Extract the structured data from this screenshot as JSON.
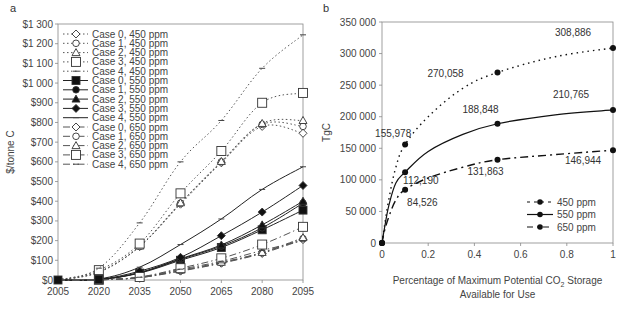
{
  "chart_data": [
    {
      "panel": "a",
      "type": "line",
      "title": "",
      "xlabel": "",
      "ylabel": "$/tonne C",
      "ylim": [
        0,
        1300
      ],
      "y_ticks": [
        "$0",
        "$100",
        "$200",
        "$300",
        "$400",
        "$500",
        "$600",
        "$700",
        "$800",
        "$900",
        "$1 000",
        "$1 100",
        "$1 200",
        "$1 300"
      ],
      "x": [
        "2005",
        "2020",
        "2035",
        "2050",
        "2065",
        "2080",
        "2095"
      ],
      "grid": false,
      "legend_position": "upper-left inside",
      "series": [
        {
          "name": "Case 0, 450 ppm",
          "marker": "diamond-open",
          "style": "dotted",
          "values": [
            0,
            40,
            170,
            385,
            595,
            780,
            745
          ]
        },
        {
          "name": "Case 1, 450 ppm",
          "marker": "circle-open",
          "style": "dotted",
          "values": [
            0,
            40,
            170,
            390,
            600,
            790,
            780
          ]
        },
        {
          "name": "Case 2, 450 ppm",
          "marker": "triangle-open",
          "style": "dotted",
          "values": [
            0,
            42,
            172,
            392,
            602,
            795,
            810
          ]
        },
        {
          "name": "Case 3, 450 ppm",
          "marker": "square-open",
          "style": "dotted",
          "values": [
            0,
            50,
            185,
            440,
            655,
            900,
            950
          ]
        },
        {
          "name": "Case 4, 450 ppm",
          "marker": "dash",
          "style": "dotted",
          "values": [
            0,
            60,
            290,
            600,
            810,
            1075,
            1245
          ]
        },
        {
          "name": "Case 0, 550 ppm",
          "marker": "square-filled",
          "style": "solid",
          "values": [
            0,
            2,
            35,
            100,
            165,
            255,
            355
          ]
        },
        {
          "name": "Case 1, 550 ppm",
          "marker": "circle-filled",
          "style": "solid",
          "values": [
            0,
            2,
            37,
            105,
            172,
            265,
            390
          ]
        },
        {
          "name": "Case 2, 550 ppm",
          "marker": "triangle-filled",
          "style": "solid",
          "values": [
            0,
            2,
            38,
            108,
            178,
            280,
            400
          ]
        },
        {
          "name": "Case 3, 550 ppm",
          "marker": "diamond-filled",
          "style": "solid",
          "values": [
            0,
            3,
            45,
            115,
            225,
            345,
            480
          ]
        },
        {
          "name": "Case 4, 550 ppm",
          "marker": "dash",
          "style": "solid",
          "values": [
            0,
            5,
            65,
            180,
            310,
            460,
            575
          ]
        },
        {
          "name": "Case 0, 650 ppm",
          "marker": "diamond-open",
          "style": "dash-dot",
          "values": [
            0,
            1,
            12,
            45,
            85,
            135,
            205
          ]
        },
        {
          "name": "Case 1, 650 ppm",
          "marker": "circle-open",
          "style": "dash-dot",
          "values": [
            0,
            1,
            12,
            47,
            87,
            138,
            210
          ]
        },
        {
          "name": "Case 2, 650 ppm",
          "marker": "triangle-open",
          "style": "dash-dot",
          "values": [
            0,
            1,
            13,
            50,
            90,
            140,
            215
          ]
        },
        {
          "name": "Case 3, 650 ppm",
          "marker": "square-open",
          "style": "dash-dot",
          "values": [
            0,
            1,
            15,
            60,
            110,
            180,
            270
          ]
        },
        {
          "name": "Case 4, 650 ppm",
          "marker": "dash",
          "style": "dash-dot",
          "values": [
            0,
            1,
            14,
            55,
            95,
            150,
            200
          ]
        }
      ]
    },
    {
      "panel": "b",
      "type": "line",
      "title": "",
      "xlabel": "Percentage of Maximum Potential CO2 Storage Available for Use",
      "xlabel_line1": "Percentage of Maximum Potential CO",
      "xlabel_sub": "2",
      "xlabel_line1_end": " Storage",
      "xlabel_line2": "Available for Use",
      "ylabel": "TgC",
      "ylim": [
        0,
        350000
      ],
      "xlim": [
        0,
        1
      ],
      "y_ticks": [
        "0",
        "50 000",
        "100 000",
        "150 000",
        "200 000",
        "250 000",
        "300 000",
        "350 000"
      ],
      "x_ticks": [
        "0",
        "0.2",
        "0.4",
        "0.6",
        "0.8",
        "1"
      ],
      "grid": false,
      "legend_position": "lower-right inside",
      "series": [
        {
          "name": "450 ppm",
          "style": "dotted",
          "x": [
            0,
            0.1,
            0.5,
            1
          ],
          "values": [
            0,
            155978,
            270058,
            308886
          ],
          "labels": [
            "",
            "155,978",
            "270,058",
            "308,886"
          ]
        },
        {
          "name": "550 ppm",
          "style": "solid",
          "x": [
            0,
            0.1,
            0.5,
            1
          ],
          "values": [
            0,
            112190,
            188848,
            210765
          ],
          "labels": [
            "",
            "112,190",
            "188,848",
            "210,765"
          ]
        },
        {
          "name": "650 ppm",
          "style": "dash-dot",
          "x": [
            0,
            0.1,
            0.5,
            1
          ],
          "values": [
            0,
            84526,
            131863,
            146944
          ],
          "labels": [
            "",
            "84,526",
            "131,863",
            "146,944"
          ]
        }
      ]
    }
  ]
}
